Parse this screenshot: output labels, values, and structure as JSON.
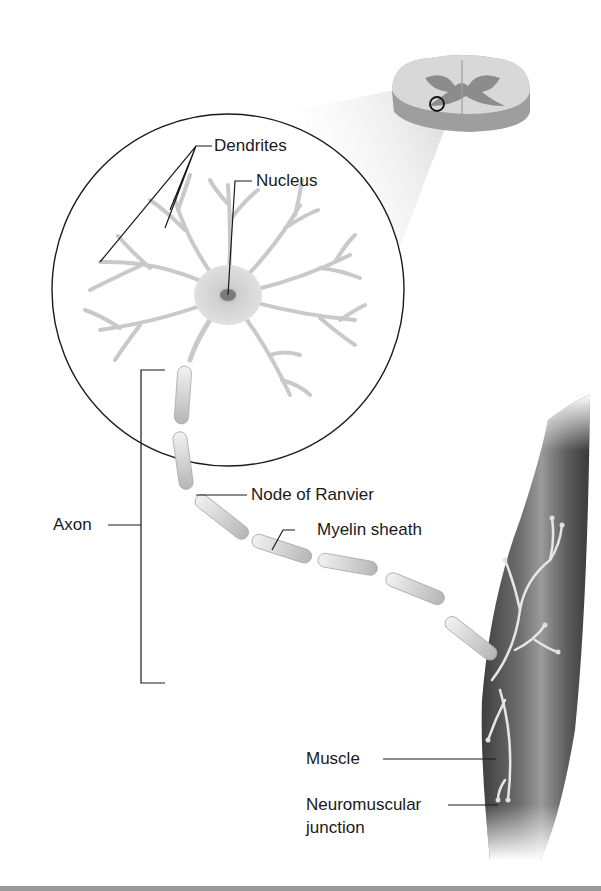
{
  "figure": {
    "title_visible": false,
    "colors": {
      "background": "#ffffff",
      "line": "#1a1a1a",
      "neuron": "#d9d9d9",
      "muscle_dark": "#4a4a4a",
      "muscle_light": "#8a8a8a",
      "spinal_gray": "#8c8c8c",
      "spinal_white": "#d6d6d6",
      "bottom_strip": "#9a9a9a"
    }
  },
  "labels": {
    "dendrites": "Dendrites",
    "nucleus": "Nucleus",
    "axon": "Axon",
    "node_of_ranvier": "Node of Ranvier",
    "myelin_sheath": "Myelin sheath",
    "muscle": "Muscle",
    "neuromuscular_junction_line1": "Neuromuscular",
    "neuromuscular_junction_line2": "junction"
  }
}
